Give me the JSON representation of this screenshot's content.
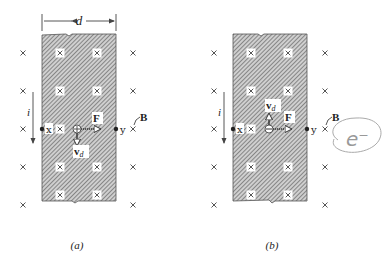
{
  "figure": {
    "panels": [
      {
        "id": "a",
        "caption": "(a)",
        "width_label": "d",
        "current_label": "i",
        "point_left_label": "x",
        "point_right_label": "y",
        "force_label": "F",
        "velocity_label": "v",
        "velocity_subscript": "d",
        "field_label": "B",
        "carrier_sign": "+",
        "velocity_direction": "down",
        "force_direction": "right"
      },
      {
        "id": "b",
        "caption": "(b)",
        "current_label": "i",
        "point_left_label": "x",
        "point_right_label": "y",
        "force_label": "F",
        "velocity_label": "v",
        "velocity_subscript": "d",
        "field_label": "B",
        "carrier_sign": "−",
        "velocity_direction": "up",
        "force_direction": "right"
      }
    ],
    "annotation": {
      "handwritten_text": "e⁻"
    },
    "colors": {
      "hatch": "#6a6a6a",
      "ink": "#222222",
      "background": "#ffffff",
      "annotation": "#a0a0a0"
    }
  }
}
